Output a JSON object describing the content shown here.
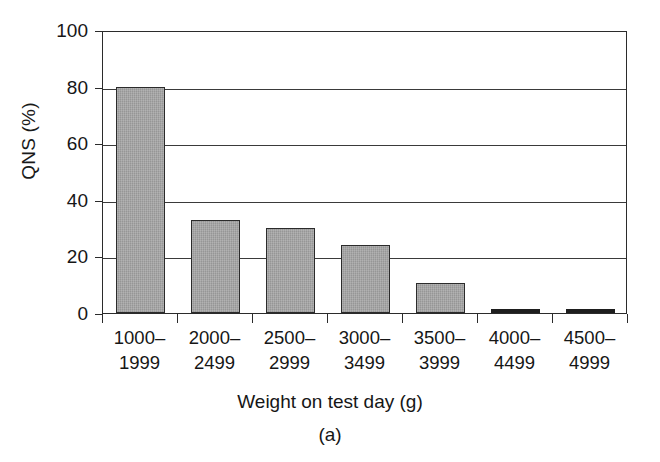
{
  "chart_data": {
    "type": "bar",
    "title": "",
    "subtitle": "",
    "xlabel": "Weight on test day (g)",
    "ylabel": "QNS (%)",
    "caption": "(a)",
    "categories": [
      "1000–1999",
      "2000–2499",
      "2500–2999",
      "3000–3499",
      "3500–3999",
      "4000–4499",
      "4500–4999"
    ],
    "category_lines": [
      [
        "1000–",
        "1999"
      ],
      [
        "2000–",
        "2499"
      ],
      [
        "2500–",
        "2999"
      ],
      [
        "3000–",
        "3499"
      ],
      [
        "3500–",
        "3999"
      ],
      [
        "4000–",
        "4499"
      ],
      [
        "4500–",
        "4999"
      ]
    ],
    "values": [
      80.0,
      33.0,
      30.0,
      24.0,
      10.5,
      0.4,
      0.4
    ],
    "ylim": [
      0,
      100
    ],
    "xlim_index": [
      0,
      7
    ],
    "ytick_labels": [
      "0",
      "20",
      "40",
      "60",
      "80",
      "100"
    ],
    "ytick_values": [
      0,
      20,
      40,
      60,
      80,
      100
    ],
    "grid": "horizontal",
    "legend": "none",
    "bar_fill_color": "#9e9e9e",
    "bar_edge_color": "#2b2b2b",
    "axis_color": "#2b2b2b",
    "background_color": "#ffffff"
  }
}
